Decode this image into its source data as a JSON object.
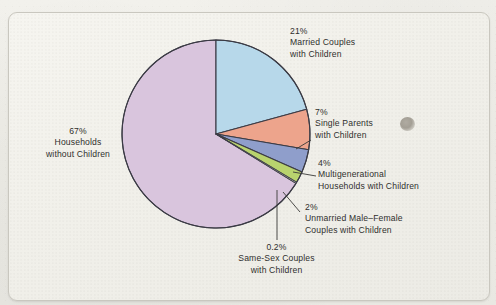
{
  "page": {
    "caption_fragment": "",
    "background_color": "#efeee9",
    "card_color": "#f3f2ec",
    "artifact": "gray-smudge"
  },
  "chart_data": {
    "type": "pie",
    "title": "",
    "categories": [
      "Married Couples with Children",
      "Single Parents with Children",
      "Multigenerational Households with Children",
      "Unmarried Male-Female Couples with Children",
      "Same-Sex Couples with Children",
      "Households without Children"
    ],
    "values": [
      21,
      7,
      4,
      2,
      0.2,
      67
    ],
    "value_labels": [
      "21%",
      "7%",
      "4%",
      "2%",
      "0.2%",
      "67%"
    ],
    "colors": [
      "#b7d8ea",
      "#eda48c",
      "#8f9ecb",
      "#b9d36e",
      "#cfd8c6",
      "#d9c5dd"
    ],
    "start_angle_deg": 0,
    "direction": "clockwise",
    "legend": "callout-labels",
    "grid": false,
    "slices": [
      {
        "name": "married-couples-with-children",
        "percent_label": "21%",
        "line1": "Married Couples",
        "line2": "with Children",
        "color": "#b7d8ea",
        "value": 21
      },
      {
        "name": "single-parents-with-children",
        "percent_label": "7%",
        "line1": "Single Parents",
        "line2": "with Children",
        "color": "#eda48c",
        "value": 7
      },
      {
        "name": "multigenerational-households-with-children",
        "percent_label": "4%",
        "line1": "Multigenerational",
        "line2": "Households with Children",
        "color": "#8f9ecb",
        "value": 4
      },
      {
        "name": "unmarried-male-female-couples-with-children",
        "percent_label": "2%",
        "line1": "Unmarried Male–Female",
        "line2": "Couples with Children",
        "color": "#b9d36e",
        "value": 2
      },
      {
        "name": "same-sex-couples-with-children",
        "percent_label": "0.2%",
        "line1": "Same-Sex Couples",
        "line2": "with Children",
        "color": "#cfd8c6",
        "value": 0.2
      },
      {
        "name": "households-without-children",
        "percent_label": "67%",
        "line1": "Households",
        "line2": "without Children",
        "color": "#d9c5dd",
        "value": 67
      }
    ]
  }
}
